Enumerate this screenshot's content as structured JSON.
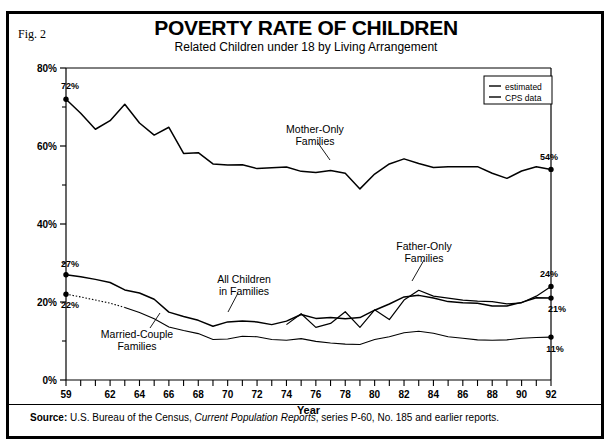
{
  "figure": {
    "fig_label": "Fig. 2",
    "title": "POVERTY RATE OF CHILDREN",
    "subtitle": "Related Children under 18 by Living Arrangement"
  },
  "source": {
    "prefix": "Source:",
    "text_1": " U.S. Bureau of the Census, ",
    "italic": "Current Population Reports",
    "text_2": ", series P-60, No. 185 and earlier reports."
  },
  "legend": {
    "items": [
      {
        "label": "estimated",
        "style": "solid"
      },
      {
        "label": "CPS data",
        "style": "solid"
      }
    ]
  },
  "annotations": [
    {
      "name": "mother-only",
      "line1": "Mother-Only",
      "line2": "Families"
    },
    {
      "name": "father-only",
      "line1": "Father-Only",
      "line2": "Families"
    },
    {
      "name": "all-children",
      "line1": "All  Children",
      "line2": "in Families"
    },
    {
      "name": "married-couple",
      "line1": "Married-Couple",
      "line2": "Families"
    }
  ],
  "endpoint_labels": {
    "mother_start": "72%",
    "mother_end": "54%",
    "all_children_start": "27%",
    "all_children_end": "21%",
    "married_start": "22%",
    "married_end": "11%",
    "father_end": "24%"
  },
  "chart_data": {
    "type": "line",
    "title": "POVERTY RATE OF CHILDREN",
    "subtitle": "Related Children under 18 by Living Arrangement",
    "xlabel": "Year",
    "ylabel": "",
    "xlim": [
      1959,
      1992
    ],
    "ylim": [
      0,
      80
    ],
    "ytick_labels": [
      "0%",
      "20%",
      "40%",
      "60%",
      "80%"
    ],
    "yticks": [
      0,
      20,
      40,
      60,
      80
    ],
    "yticks_minor": [
      10,
      30,
      50,
      70
    ],
    "xtick_labels": [
      "59",
      "62",
      "64",
      "66",
      "68",
      "70",
      "72",
      "74",
      "76",
      "78",
      "80",
      "82",
      "84",
      "86",
      "88",
      "90",
      "92"
    ],
    "xticks": [
      1959,
      1962,
      1964,
      1966,
      1968,
      1970,
      1972,
      1974,
      1976,
      1978,
      1980,
      1982,
      1984,
      1986,
      1988,
      1990,
      1992
    ],
    "grid": false,
    "legend_position": "top-right",
    "x": [
      1959,
      1960,
      1961,
      1962,
      1963,
      1964,
      1965,
      1966,
      1967,
      1968,
      1969,
      1970,
      1971,
      1972,
      1973,
      1974,
      1975,
      1976,
      1977,
      1978,
      1979,
      1980,
      1981,
      1982,
      1983,
      1984,
      1985,
      1986,
      1987,
      1988,
      1989,
      1990,
      1991,
      1992
    ],
    "series": [
      {
        "name": "Mother-Only Families",
        "values": [
          72.0,
          68.4,
          64.3,
          66.5,
          70.7,
          65.9,
          62.8,
          64.8,
          58.1,
          58.3,
          55.4,
          55.1,
          55.2,
          54.2,
          54.4,
          54.6,
          53.5,
          53.2,
          53.7,
          53.0,
          49.0,
          52.8,
          55.4,
          56.7,
          55.5,
          54.5,
          54.7,
          54.7,
          54.7,
          53.0,
          51.7,
          53.6,
          54.7,
          54.0
        ],
        "style": "solid",
        "start_label": "72%",
        "end_label": "54%"
      },
      {
        "name": "All Children in Families",
        "values": [
          27.0,
          26.5,
          25.8,
          25.0,
          23.1,
          22.3,
          20.7,
          17.4,
          16.3,
          15.3,
          13.8,
          14.9,
          15.1,
          14.9,
          14.2,
          15.1,
          16.8,
          15.8,
          16.0,
          15.7,
          16.0,
          17.9,
          19.5,
          21.3,
          21.7,
          21.0,
          20.1,
          19.8,
          19.7,
          19.0,
          19.0,
          19.9,
          21.1,
          21.0
        ],
        "style": "solid",
        "start_label": "27%",
        "end_label": "21%"
      },
      {
        "name": "Father-Only Families",
        "values": [
          null,
          null,
          null,
          null,
          null,
          null,
          null,
          null,
          null,
          null,
          null,
          null,
          null,
          null,
          null,
          14.2,
          17.0,
          13.5,
          14.5,
          17.5,
          13.5,
          18.0,
          15.5,
          20.5,
          23.0,
          21.5,
          21.0,
          20.5,
          20.2,
          20.1,
          19.5,
          19.8,
          21.5,
          24.0
        ],
        "style": "solid",
        "end_label": "24%"
      },
      {
        "name": "Married-Couple Families",
        "values": [
          22.0,
          21.3,
          20.5,
          19.7,
          18.6,
          17.3,
          15.7,
          13.6,
          12.7,
          11.9,
          10.4,
          10.5,
          11.2,
          11.1,
          10.4,
          10.2,
          10.6,
          9.9,
          9.5,
          9.2,
          9.1,
          10.4,
          11.1,
          12.1,
          12.5,
          12.0,
          11.1,
          10.7,
          10.3,
          10.2,
          10.3,
          10.7,
          10.9,
          11.0
        ],
        "style": "dotted-then-solid",
        "start_label": "22%",
        "end_label": "11%"
      }
    ]
  }
}
